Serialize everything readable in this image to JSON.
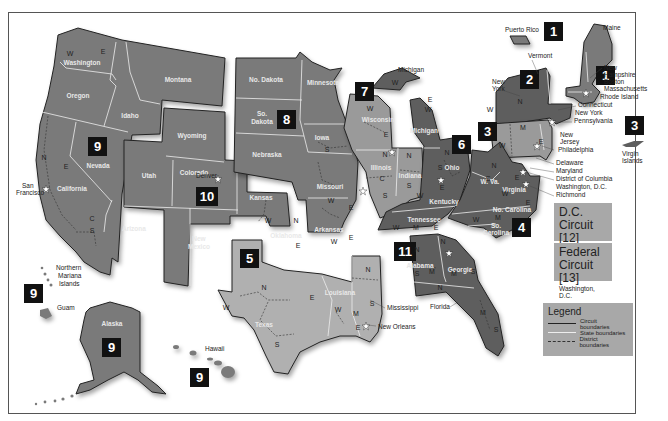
{
  "colors": {
    "circuit_dark": "#5e5e5e",
    "circuit_mid": "#7a7a7a",
    "circuit_light": "#9a9a9a",
    "circuit_lightest": "#b0b0b0",
    "badge": "#111111",
    "box_bg": "#a8a8a8"
  },
  "circuits": [
    {
      "number": "1",
      "states": [
        "Maine",
        "New Hampshire",
        "Massachusetts",
        "Rhode Island",
        "Puerto Rico"
      ],
      "seat": "Boston"
    },
    {
      "number": "2",
      "states": [
        "Vermont",
        "New York",
        "Connecticut"
      ],
      "seat": "New York"
    },
    {
      "number": "3",
      "states": [
        "Pennsylvania",
        "New Jersey",
        "Delaware",
        "Virgin Islands"
      ],
      "seat": "Philadelphia"
    },
    {
      "number": "4",
      "states": [
        "Maryland",
        "W. Va.",
        "Virginia",
        "No. Carolina",
        "So. Carolina"
      ],
      "seat": "Richmond"
    },
    {
      "number": "5",
      "states": [
        "Texas",
        "Louisiana",
        "Mississippi"
      ],
      "seat": "New Orleans"
    },
    {
      "number": "6",
      "states": [
        "Michigan",
        "Ohio",
        "Kentucky",
        "Tennessee"
      ],
      "seat": "Cincinnati"
    },
    {
      "number": "7",
      "states": [
        "Wisconsin",
        "Illinois",
        "Indiana"
      ],
      "seat": "Chicago"
    },
    {
      "number": "8",
      "states": [
        "No. Dakota",
        "So. Dakota",
        "Nebraska",
        "Minnesota",
        "Iowa",
        "Missouri",
        "Arkansas"
      ],
      "seat": "St. Louis"
    },
    {
      "number": "9",
      "states": [
        "Washington",
        "Oregon",
        "Idaho",
        "Montana",
        "Nevada",
        "California",
        "Arizona",
        "Alaska",
        "Hawaii",
        "Guam",
        "Northern Mariana Islands"
      ],
      "seat": "San Francisco"
    },
    {
      "number": "10",
      "states": [
        "Wyoming",
        "Utah",
        "Colorado",
        "Kansas",
        "New Mexico",
        "Oklahoma"
      ],
      "seat": "Denver"
    },
    {
      "number": "11",
      "states": [
        "Alabama",
        "Georgia",
        "Florida"
      ],
      "seat": "Atlanta"
    }
  ],
  "state_labels": {
    "washington": "Washington",
    "oregon": "Oregon",
    "idaho": "Idaho",
    "montana": "Montana",
    "nevada": "Nevada",
    "california": "California",
    "arizona": "Arizona",
    "utah": "Utah",
    "wyoming": "Wyoming",
    "colorado": "Colorado",
    "new_mexico": "New\nMexico",
    "kansas": "Kansas",
    "oklahoma": "Oklahoma",
    "no_dakota": "No. Dakota",
    "so_dakota": "So.\nDakota",
    "nebraska": "Nebraska",
    "minnesota": "Minnesota",
    "iowa": "Iowa",
    "missouri": "Missouri",
    "arkansas": "Arkansas",
    "texas": "Texas",
    "louisiana": "Louisiana",
    "wisconsin": "Wisconsin",
    "illinois": "Illinois",
    "indiana": "Indiana",
    "michigan": "Michigan",
    "ohio": "Ohio",
    "kentucky": "Kentucky",
    "tennessee": "Tennessee",
    "alabama": "Alabama",
    "georgia": "Georgia",
    "w_va": "W. Va.",
    "virginia": "Virginia",
    "no_carolina": "No. Carolina",
    "so_carolina": "So.\nCarolina",
    "alaska": "Alaska"
  },
  "callouts": {
    "puerto_rico": "Puerto Rico",
    "maine": "Maine",
    "vermont": "Vermont",
    "new_york_state": "New\nYork",
    "new_hampshire": "New\nHampshire",
    "boston": "Boston",
    "massachusetts": "Massachusetts",
    "rhode_island": "Rhode Island",
    "connecticut": "Connecticut",
    "new_york_city": "New York",
    "pennsylvania": "Pennsylvania",
    "new_jersey": "New\nJersey",
    "philadelphia": "Philadelphia",
    "delaware": "Delaware",
    "maryland": "Maryland",
    "district_of_columbia": "District of Columbia",
    "washington_dc": "Washington, D.C.",
    "richmond": "Richmond",
    "virgin_islands": "Virgin\nIslands",
    "michigan_up": "Michigan",
    "chicago": "Chicago",
    "st_louis": "St. Louis",
    "cincinnati": "Cincinnati",
    "atlanta": "Atlanta",
    "mississippi": "Mississippi",
    "new_orleans": "New Orleans",
    "florida": "Florida",
    "denver": "Denver",
    "san_francisco": "San\nFrancisco",
    "northern_mariana": "Northern\nMariana\nIslands",
    "guam": "Guam",
    "hawaii": "Hawaii"
  },
  "side_boxes": [
    {
      "title_line1": "D.C.",
      "title_line2": "Circuit [12]",
      "subtitle": "Washington, D.C."
    },
    {
      "title_line1": "Federal",
      "title_line2": "Circuit [13]",
      "subtitle": "Washington, D.C."
    }
  ],
  "legend": {
    "title": "Legend",
    "items": [
      {
        "label": "Circuit boundaries",
        "style": "solid-dark"
      },
      {
        "label": "State boundaries",
        "style": "solid-light"
      },
      {
        "label": "District boundaries",
        "style": "dashed"
      }
    ]
  }
}
